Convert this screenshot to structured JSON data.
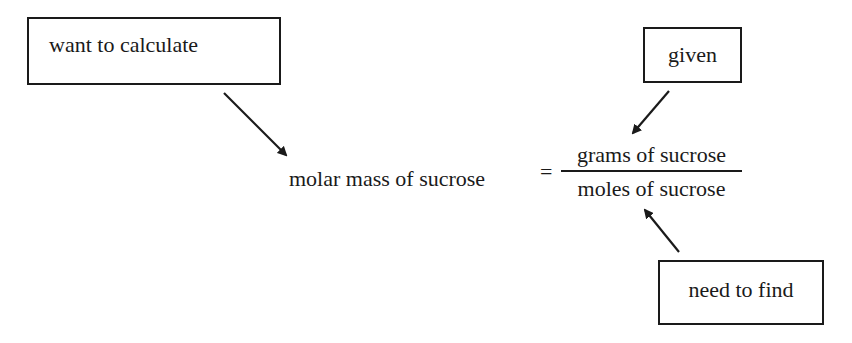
{
  "diagram": {
    "labels": {
      "want": "want to calculate",
      "given": "given",
      "need": "need to find"
    },
    "equation": {
      "lhs": "molar mass of sucrose",
      "equals": "=",
      "numerator": "grams of sucrose",
      "denominator": "moles of sucrose"
    },
    "arrows": [
      {
        "from": "want",
        "to": "lhs",
        "direction": "down-right"
      },
      {
        "from": "given",
        "to": "numerator",
        "direction": "down-left"
      },
      {
        "from": "need",
        "to": "denominator",
        "direction": "up-left"
      }
    ],
    "colors": {
      "ink": "#1a1a1a",
      "background": "#ffffff"
    }
  }
}
